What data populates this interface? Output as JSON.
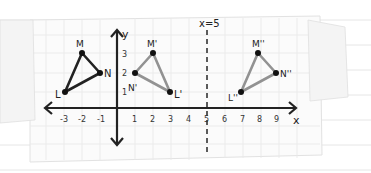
{
  "diagram": {
    "type": "coordinate-plane-transformations",
    "axes": {
      "x_label": "x",
      "y_label": "y",
      "x_ticks": [
        "-3",
        "-2",
        "-1",
        "1",
        "2",
        "3",
        "4",
        "5",
        "6",
        "7",
        "8",
        "9"
      ],
      "y_ticks": [
        "1",
        "2",
        "3"
      ]
    },
    "line_of_reflection": {
      "label": "x=5",
      "x": 5,
      "style": "dashed"
    },
    "triangles": [
      {
        "name": "LMN",
        "color": "#222222",
        "points": [
          {
            "label": "L",
            "x": -3,
            "y": 1
          },
          {
            "label": "M",
            "x": -2,
            "y": 3
          },
          {
            "label": "N",
            "x": -1,
            "y": 2
          }
        ]
      },
      {
        "name": "L'M'N'",
        "color": "#8f8f8f",
        "points": [
          {
            "label": "L'",
            "x": 3,
            "y": 1
          },
          {
            "label": "M'",
            "x": 2,
            "y": 3
          },
          {
            "label": "N'",
            "x": 1,
            "y": 2
          }
        ]
      },
      {
        "name": "L''M''N''",
        "color": "#8f8f8f",
        "points": [
          {
            "label": "L''",
            "x": 7,
            "y": 1
          },
          {
            "label": "M''",
            "x": 8,
            "y": 3
          },
          {
            "label": "N''",
            "x": 9,
            "y": 2
          }
        ]
      }
    ]
  },
  "labels": {
    "L": "L",
    "M": "M",
    "N": "N",
    "L1": "L'",
    "M1": "M'",
    "N1": "N'",
    "L2": "L''",
    "M2": "M''",
    "N2": "N''",
    "x_axis": "x",
    "y_axis": "y",
    "reflection": "x=5"
  },
  "ticks": {
    "xm3": "-3",
    "xm2": "-2",
    "xm1": "-1",
    "x1": "1",
    "x2": "2",
    "x3": "3",
    "x4": "4",
    "x5": "5",
    "x6": "6",
    "x7": "7",
    "x8": "8",
    "x9": "9",
    "y1": "1",
    "y2": "2",
    "y3": "3"
  }
}
